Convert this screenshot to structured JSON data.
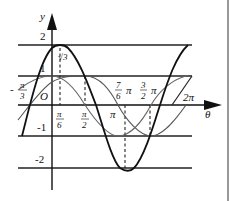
{
  "diagram": {
    "title": "",
    "axes": {
      "x_label": "θ",
      "y_label": "y"
    },
    "y_ticks": [
      {
        "label": "2",
        "value": 2
      },
      {
        "label": "1",
        "value": 1
      },
      {
        "label": "-1",
        "value": -1
      },
      {
        "label": "-2",
        "value": -2
      }
    ],
    "origin_label": "O",
    "x_ticks": [
      {
        "label_num": "π",
        "label_den": "3",
        "prefix": "-",
        "value": "-π/3"
      },
      {
        "label_num": "π",
        "label_den": "6",
        "prefix": "",
        "value": "π/6"
      },
      {
        "label_num": "π",
        "label_den": "2",
        "prefix": "",
        "value": "π/2"
      },
      {
        "label": "π",
        "value": "π"
      },
      {
        "label_num": "7",
        "label_den": "6",
        "suffix": "π",
        "value": "7π/6"
      },
      {
        "label_num": "3",
        "label_den": "2",
        "suffix": "π",
        "value": "3π/2"
      },
      {
        "label": "2π",
        "value": "2π"
      }
    ],
    "annotation": {
      "text": "√3",
      "at": "θ = π/6, y = √3"
    },
    "curves": [
      {
        "name": "y = 2cos(θ - π/6)",
        "style": "bold",
        "color": "#111111"
      },
      {
        "name": "y = sin θ",
        "style": "thin",
        "color": "#444444"
      },
      {
        "name": "y = cos θ",
        "style": "thin",
        "color": "#666666"
      }
    ],
    "reference_lines": [
      "y = 2",
      "y = 1",
      "y = -1",
      "y = -2"
    ]
  }
}
